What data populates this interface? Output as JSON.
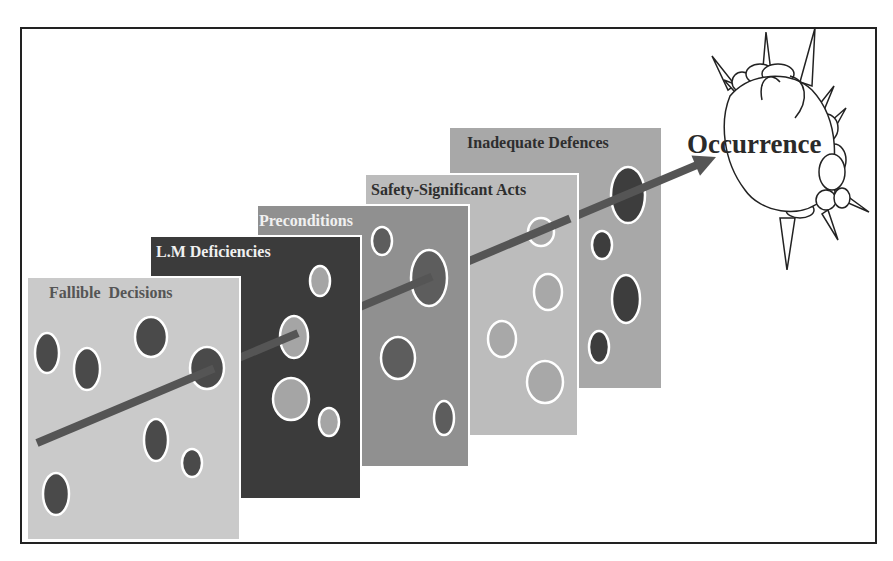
{
  "diagram": {
    "colors": {
      "frame": "#222222",
      "arrow": "#555555",
      "hole_outline": "#ffffff"
    },
    "panels": [
      {
        "label": "Fallible  Decisions",
        "bg": "#cacaca",
        "label_color": "#555555",
        "hole_fill": "#4a4a4a",
        "x": 27,
        "y": 277,
        "w": 213,
        "h": 263,
        "holes": [
          {
            "cx": 47,
            "cy": 353,
            "rx": 12,
            "ry": 20
          },
          {
            "cx": 87,
            "cy": 369,
            "rx": 13,
            "ry": 21
          },
          {
            "cx": 151,
            "cy": 337,
            "rx": 16,
            "ry": 20
          },
          {
            "cx": 207,
            "cy": 368,
            "rx": 17,
            "ry": 21
          },
          {
            "cx": 156,
            "cy": 440,
            "rx": 12,
            "ry": 21
          },
          {
            "cx": 192,
            "cy": 463,
            "rx": 10,
            "ry": 14
          },
          {
            "cx": 56,
            "cy": 494,
            "rx": 13,
            "ry": 21
          }
        ]
      },
      {
        "label": "L.M Deficiencies",
        "bg": "#3b3b3b",
        "label_color": "#f0f0f0",
        "hole_fill": "#a5a5a5",
        "x": 150,
        "y": 236,
        "w": 211,
        "h": 263,
        "holes": [
          {
            "cx": 320,
            "cy": 281,
            "rx": 10,
            "ry": 15
          },
          {
            "cx": 294,
            "cy": 337,
            "rx": 14,
            "ry": 21
          },
          {
            "cx": 291,
            "cy": 399,
            "rx": 18,
            "ry": 21
          },
          {
            "cx": 329,
            "cy": 422,
            "rx": 10,
            "ry": 14
          }
        ]
      },
      {
        "label": "Preconditions",
        "bg": "#909090",
        "label_color": "#f0f0f0",
        "hole_fill": "#5d5d5d",
        "x": 257,
        "y": 205,
        "w": 212,
        "h": 262,
        "holes": [
          {
            "cx": 382,
            "cy": 241,
            "rx": 10,
            "ry": 14
          },
          {
            "cx": 429,
            "cy": 278,
            "rx": 18,
            "ry": 28
          },
          {
            "cx": 398,
            "cy": 358,
            "rx": 17,
            "ry": 21
          },
          {
            "cx": 444,
            "cy": 418,
            "rx": 10,
            "ry": 17
          }
        ]
      },
      {
        "label": "Safety-Significant Acts",
        "bg": "#bcbcbc",
        "label_color": "#2e2e2e",
        "hole_fill": "#a8a8a8",
        "x": 365,
        "y": 174,
        "w": 213,
        "h": 262,
        "holes": [
          {
            "cx": 541,
            "cy": 232,
            "rx": 13,
            "ry": 14
          },
          {
            "cx": 548,
            "cy": 292,
            "rx": 14,
            "ry": 18
          },
          {
            "cx": 502,
            "cy": 339,
            "rx": 14,
            "ry": 18
          },
          {
            "cx": 545,
            "cy": 382,
            "rx": 18,
            "ry": 21
          }
        ]
      },
      {
        "label": "Inadequate Defences",
        "bg": "#a8a8a8",
        "label_color": "#2e2e2e",
        "hole_fill": "#3d3d3d",
        "x": 449,
        "y": 127,
        "w": 213,
        "h": 262,
        "holes": [
          {
            "cx": 628,
            "cy": 195,
            "rx": 17,
            "ry": 28
          },
          {
            "cx": 602,
            "cy": 245,
            "rx": 10,
            "ry": 14
          },
          {
            "cx": 626,
            "cy": 299,
            "rx": 14,
            "ry": 24
          },
          {
            "cx": 599,
            "cy": 347,
            "rx": 10,
            "ry": 16
          }
        ]
      }
    ],
    "outcome": {
      "label": "Occurrence",
      "color": "#2a2a2a"
    },
    "trajectory": {
      "from": [
        37,
        443
      ],
      "to": [
        716,
        157
      ]
    }
  }
}
